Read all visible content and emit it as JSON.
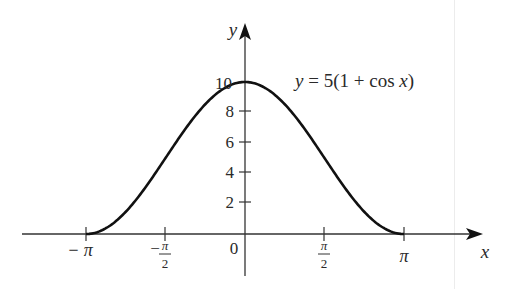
{
  "chart_data": {
    "type": "line",
    "title": "",
    "function": "y = 5(1 + cos x)",
    "annotation": "y = 5(1 + cos x)",
    "xlabel": "x",
    "ylabel": "y",
    "xlim": [
      -3.14159,
      3.14159
    ],
    "ylim": [
      0,
      10
    ],
    "grid": false,
    "legend": "none",
    "x_ticks": [
      {
        "value": -3.14159,
        "label": "−π"
      },
      {
        "value": -1.5708,
        "label": "−π/2"
      },
      {
        "value": 0,
        "label": "0"
      },
      {
        "value": 1.5708,
        "label": "π/2"
      },
      {
        "value": 3.14159,
        "label": "π"
      }
    ],
    "y_ticks": [
      {
        "value": 2,
        "label": "2"
      },
      {
        "value": 4,
        "label": "4"
      },
      {
        "value": 6,
        "label": "6"
      },
      {
        "value": 8,
        "label": "8"
      },
      {
        "value": 10,
        "label": "10"
      }
    ],
    "series": [
      {
        "name": "5(1 + cos x)",
        "x": [
          -3.14159,
          -2.35619,
          -1.5708,
          -0.7854,
          0,
          0.7854,
          1.5708,
          2.35619,
          3.14159
        ],
        "y": [
          0,
          1.46,
          5,
          8.54,
          10,
          8.54,
          5,
          1.46,
          0
        ]
      }
    ],
    "colors": {
      "curve": "#111111",
      "axes": "#333333",
      "text": "#2a2a2a"
    }
  },
  "labels": {
    "y_axis": "y",
    "x_axis": "x",
    "equation": "y = 5(1 + cos x)",
    "origin": "0",
    "y10": "10",
    "y8": "8",
    "y6": "6",
    "y4": "4",
    "y2": "2",
    "xneg_pi": "− π",
    "xneg_half_minus": "−",
    "pi": "π",
    "two": "2"
  }
}
